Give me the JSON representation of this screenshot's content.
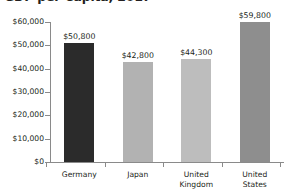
{
  "chart_data": {
    "type": "bar",
    "title": "GDP per Capita, 2017",
    "xlabel": "",
    "ylabel": "",
    "categories": [
      "Germany",
      "Japan",
      "United Kingdom",
      "United States"
    ],
    "values": [
      50800,
      42800,
      44300,
      59800
    ],
    "value_labels": [
      "$50,800",
      "$42,800",
      "$44,300",
      "$59,800"
    ],
    "bar_colors": [
      "#2b2b2b",
      "#b2b2b2",
      "#bdbdbd",
      "#8e8e8e"
    ],
    "ylim": [
      0,
      60000
    ],
    "yticks": [
      0,
      10000,
      20000,
      30000,
      40000,
      50000,
      60000
    ],
    "ytick_labels": [
      "$0",
      "$10,000",
      "$20,000",
      "$30,000",
      "$40,000",
      "$50,000",
      "$60,000"
    ],
    "grid": false,
    "legend": "none",
    "axis_color": "#8a8a8a",
    "text_color": "#231f20",
    "background": "#ffffff"
  },
  "category_lines": [
    [
      "Germany"
    ],
    [
      "Japan"
    ],
    [
      "United",
      "Kingdom"
    ],
    [
      "United",
      "States"
    ]
  ]
}
